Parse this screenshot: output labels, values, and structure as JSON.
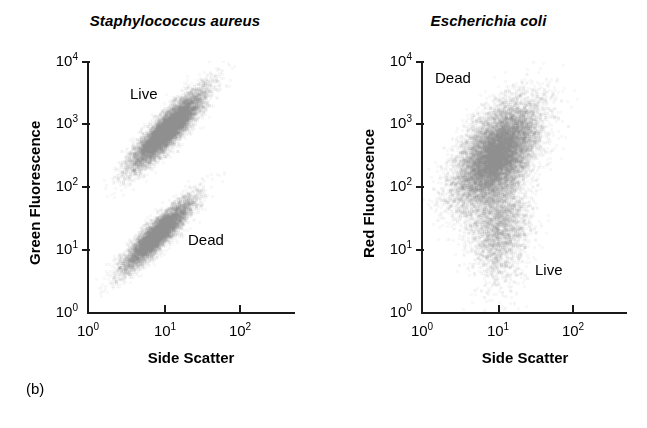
{
  "figure": {
    "caption_label": "(b)"
  },
  "panels": [
    {
      "id": "left",
      "title": "Staphylococcus aureus",
      "y_axis_title": "Green Fluorescence",
      "x_axis_title": "Side Scatter",
      "y_ticks": [
        "10 0",
        "10 1",
        "10 2",
        "10 3",
        "10 4"
      ],
      "x_ticks": [
        "10 0",
        "10 1",
        "10 2"
      ],
      "annotations": [
        {
          "label": "Live",
          "x": 130,
          "y": 86
        },
        {
          "label": "Dead",
          "x": 188,
          "y": 232
        }
      ]
    },
    {
      "id": "right",
      "title": "Escherichia coli",
      "y_axis_title": "Red Fluorescence",
      "x_axis_title": "Side Scatter",
      "y_ticks": [
        "10 0",
        "10 1",
        "10 2",
        "10 3",
        "10 4"
      ],
      "x_ticks": [
        "10 0",
        "10 1",
        "10 2"
      ],
      "annotations": [
        {
          "label": "Dead",
          "x": 105,
          "y": 70
        },
        {
          "label": "Live",
          "x": 205,
          "y": 262
        }
      ]
    }
  ],
  "chart_data": {
    "type": "scatter",
    "panel_count": 2,
    "axis_scale": "log-log",
    "xlim": [
      1,
      1000
    ],
    "ylim": [
      1,
      10000
    ],
    "grid": false,
    "legend": "none",
    "marker_color": "#808080",
    "panels": [
      {
        "title": "Staphylococcus aureus",
        "xlabel": "Side Scatter",
        "ylabel": "Green Fluorescence",
        "x_tick_values": [
          1,
          10,
          100
        ],
        "y_tick_values": [
          1,
          10,
          100,
          1000,
          10000
        ],
        "clusters": [
          {
            "name": "Live",
            "label_text": "Live",
            "n_points": 9000,
            "center_x": 14,
            "center_y": 800,
            "spread_log_x": 0.26,
            "spread_log_y": 0.3,
            "correlation": 0.88,
            "description": "Elongated diagonal streak of high green fluorescence, centred near side scatter 14 and green fluorescence 8x10^2, running from about (6, 250) up to (50, 3000)"
          },
          {
            "name": "Dead",
            "label_text": "Dead",
            "n_points": 7000,
            "center_x": 10,
            "center_y": 17,
            "spread_log_x": 0.25,
            "spread_log_y": 0.28,
            "correlation": 0.9,
            "description": "Lower diagonal streak of low green fluorescence, centred near side scatter 10 and green fluorescence 1.7x10^1, running from about (4, 7) up to (60, 150)"
          }
        ]
      },
      {
        "title": "Escherichia coli",
        "xlabel": "Side Scatter",
        "ylabel": "Red Fluorescence",
        "x_tick_values": [
          1,
          10,
          100
        ],
        "y_tick_values": [
          1,
          10,
          100,
          1000,
          10000
        ],
        "clusters": [
          {
            "name": "Dead",
            "label_text": "Dead",
            "n_points": 13000,
            "center_x": 12,
            "center_y": 330,
            "spread_log_x": 0.3,
            "spread_log_y": 0.4,
            "correlation": 0.55,
            "description": "Large diffuse cloud of high red fluorescence centred near side scatter 12 and red fluorescence 3x10^2, spanning roughly 3 to 100 in side scatter and 50 to 4000 in red fluorescence"
          },
          {
            "name": "Live",
            "label_text": "Live",
            "n_points": 3200,
            "center_x": 13,
            "center_y": 25,
            "spread_log_x": 0.22,
            "spread_log_y": 0.45,
            "correlation": 0.1,
            "description": "Sparse faint vertical tail of low red fluorescence below the main cloud, centred near side scatter 13, trailing down from about 10^2 to below 10^1"
          }
        ]
      }
    ]
  }
}
